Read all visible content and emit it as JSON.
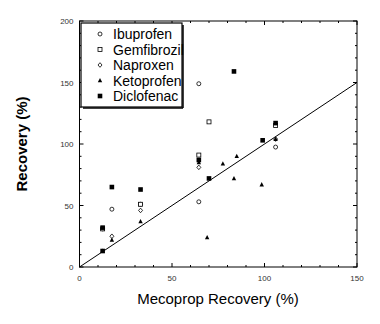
{
  "chart_data": {
    "type": "scatter",
    "title": "",
    "xlabel": "Mecoprop Recovery (%)",
    "ylabel": "Recovery (%)",
    "xlim": [
      0,
      150
    ],
    "ylim": [
      0,
      200
    ],
    "xticks": [
      0,
      50,
      100,
      150
    ],
    "yticks": [
      0,
      50,
      100,
      150,
      200
    ],
    "grid": false,
    "legend_position": "upper left",
    "reference_line": {
      "type": "1:1",
      "from": [
        0,
        0
      ],
      "to": [
        150,
        150
      ]
    },
    "series": [
      {
        "name": "Ibuprofen",
        "marker": "open-circle",
        "points": [
          [
            12.5,
            31
          ],
          [
            17.5,
            47
          ],
          [
            33,
            51
          ],
          [
            64.5,
            149
          ],
          [
            64.5,
            53
          ],
          [
            106,
            97.5
          ]
        ]
      },
      {
        "name": "Gemfibrozil",
        "marker": "open-square",
        "points": [
          [
            12.5,
            31
          ],
          [
            33,
            51
          ],
          [
            64.5,
            91
          ],
          [
            70,
            118
          ],
          [
            106,
            115
          ]
        ]
      },
      {
        "name": "Naproxen",
        "marker": "diamond",
        "points": [
          [
            17.5,
            25
          ],
          [
            33,
            46
          ],
          [
            64.5,
            81
          ],
          [
            106,
            104
          ]
        ]
      },
      {
        "name": "Ketoprofen",
        "marker": "triangle",
        "points": [
          [
            12.5,
            13
          ],
          [
            17.5,
            22
          ],
          [
            33,
            37
          ],
          [
            64.5,
            85
          ],
          [
            69,
            24
          ],
          [
            77.5,
            84
          ],
          [
            85,
            90
          ],
          [
            83.5,
            72
          ],
          [
            98.5,
            67
          ],
          [
            106,
            104
          ]
        ]
      },
      {
        "name": "Diclofenac",
        "marker": "filled-square",
        "points": [
          [
            12.5,
            32
          ],
          [
            17.5,
            65
          ],
          [
            33,
            63
          ],
          [
            64.5,
            87
          ],
          [
            70,
            72
          ],
          [
            83.5,
            159
          ],
          [
            99,
            103
          ],
          [
            106,
            117
          ],
          [
            12.5,
            13
          ]
        ]
      }
    ]
  }
}
